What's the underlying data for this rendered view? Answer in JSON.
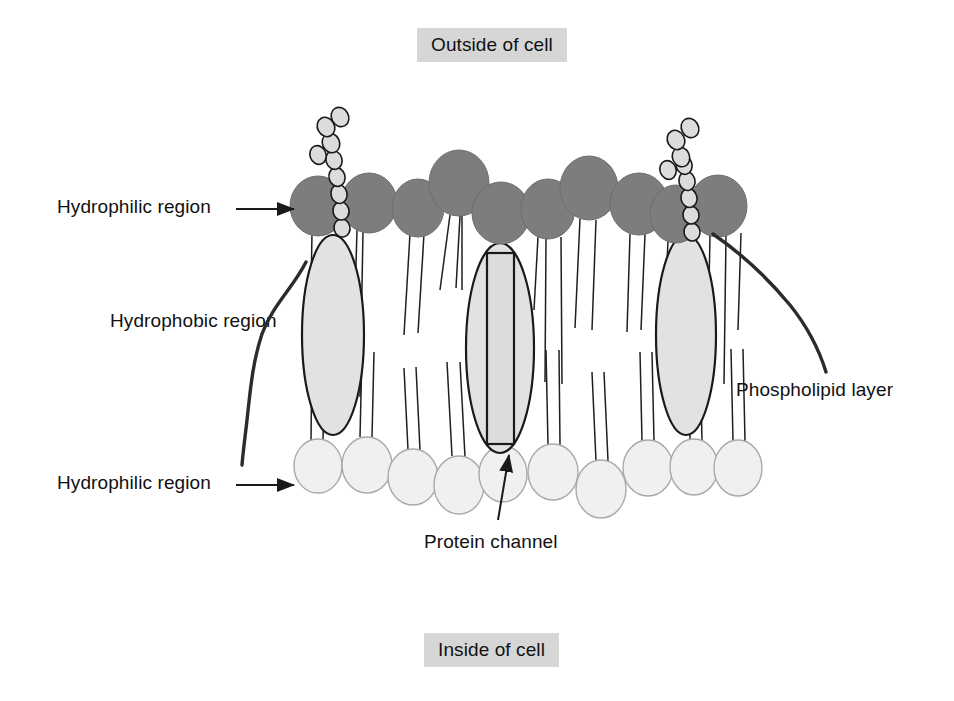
{
  "figure": {
    "background_color": "#ffffff"
  },
  "banners": {
    "outside": "Outside of cell",
    "inside": "Inside of cell",
    "background_color": "#d6d6d6",
    "text_color": "#111111"
  },
  "labels": {
    "hydrophilic_top": "Hydrophilic region",
    "hydrophobic": "Hydrophobic region",
    "hydrophilic_bottom": "Hydrophilic region",
    "phospholipid_layer": "Phospholipid layer",
    "protein_channel": "Protein channel"
  },
  "colors": {
    "head_top_fill": "#7d7d7d",
    "head_bottom_fill": "#f0f0f0",
    "head_bottom_stroke": "#a9a9a9",
    "protein_fill": "#e2e2e2",
    "channel_fill": "#dcdcdc",
    "outline": "#1a1a1a",
    "tail_stroke": "#1f1f1f"
  },
  "membrane": {
    "top_heads": [
      {
        "cx": 318,
        "cy": 206,
        "rx": 28,
        "ry": 30
      },
      {
        "cx": 369,
        "cy": 203,
        "rx": 28,
        "ry": 30
      },
      {
        "cx": 418,
        "cy": 208,
        "rx": 26,
        "ry": 29
      },
      {
        "cx": 459,
        "cy": 183,
        "rx": 30,
        "ry": 33
      },
      {
        "cx": 501,
        "cy": 213,
        "rx": 29,
        "ry": 31
      },
      {
        "cx": 548,
        "cy": 209,
        "rx": 27,
        "ry": 30
      },
      {
        "cx": 589,
        "cy": 188,
        "rx": 29,
        "ry": 32
      },
      {
        "cx": 639,
        "cy": 204,
        "rx": 29,
        "ry": 31
      },
      {
        "cx": 676,
        "cy": 214,
        "rx": 26,
        "ry": 29
      },
      {
        "cx": 718,
        "cy": 206,
        "rx": 29,
        "ry": 31
      }
    ],
    "bottom_heads": [
      {
        "cx": 318,
        "cy": 466,
        "rx": 24,
        "ry": 27
      },
      {
        "cx": 367,
        "cy": 465,
        "rx": 25,
        "ry": 28
      },
      {
        "cx": 413,
        "cy": 477,
        "rx": 25,
        "ry": 28
      },
      {
        "cx": 459,
        "cy": 485,
        "rx": 25,
        "ry": 29
      },
      {
        "cx": 503,
        "cy": 474,
        "rx": 24,
        "ry": 28
      },
      {
        "cx": 553,
        "cy": 472,
        "rx": 25,
        "ry": 28
      },
      {
        "cx": 601,
        "cy": 489,
        "rx": 25,
        "ry": 29
      },
      {
        "cx": 648,
        "cy": 468,
        "rx": 25,
        "ry": 28
      },
      {
        "cx": 694,
        "cy": 467,
        "rx": 24,
        "ry": 28
      },
      {
        "cx": 738,
        "cy": 468,
        "rx": 24,
        "ry": 28
      }
    ],
    "proteins": [
      {
        "name": "left-protein",
        "cx": 333,
        "cy": 335,
        "rx": 31,
        "ry": 100
      },
      {
        "name": "center-protein",
        "cx": 500,
        "cy": 348,
        "rx": 34,
        "ry": 105
      },
      {
        "name": "right-protein",
        "cx": 686,
        "cy": 335,
        "rx": 30,
        "ry": 100
      }
    ],
    "channel": {
      "x": 487,
      "y": 253,
      "width": 27,
      "height": 191
    },
    "glycoprotein_chains": [
      {
        "name": "left-glycoprotein",
        "beads": 9
      },
      {
        "name": "right-glycoprotein",
        "beads": 9
      }
    ],
    "tail_count_per_head": 2
  }
}
